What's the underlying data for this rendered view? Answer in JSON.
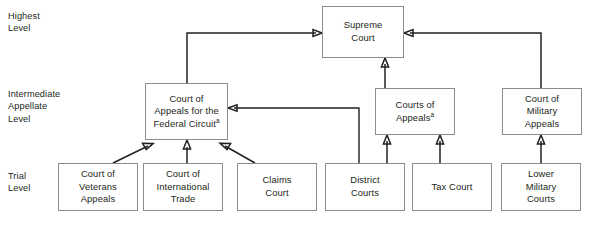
{
  "diagram": {
    "type": "hierarchy-flowchart",
    "colors": {
      "background": "#ffffff",
      "box_border": "#8c8c8c",
      "text": "#231f20",
      "arrow": "#231f20"
    },
    "level_labels": [
      {
        "id": "highest",
        "text": "Highest\nLevel"
      },
      {
        "id": "intermediate",
        "text": "Intermediate\nAppellate\nLevel"
      },
      {
        "id": "trial",
        "text": "Trial\nLevel"
      }
    ],
    "nodes": [
      {
        "id": "supreme-court",
        "label": "Supreme Court",
        "lines": [
          "Supreme",
          "Court"
        ],
        "footnote": "",
        "level": "highest"
      },
      {
        "id": "federal-circuit",
        "label": "Court of Appeals for the Federal Circuit",
        "lines": [
          "Court of",
          "Appeals for the",
          "Federal Circuit"
        ],
        "footnote": "a",
        "level": "intermediate"
      },
      {
        "id": "courts-of-appeals",
        "label": "Courts of Appeals",
        "lines": [
          "Courts of",
          "Appeals"
        ],
        "footnote": "a",
        "level": "intermediate"
      },
      {
        "id": "court-of-military-appeals",
        "label": "Court of Military Appeals",
        "lines": [
          "Court of",
          "Military",
          "Appeals"
        ],
        "footnote": "",
        "level": "intermediate"
      },
      {
        "id": "court-of-veterans-appeals",
        "label": "Court of Veterans Appeals",
        "lines": [
          "Court of",
          "Veterans",
          "Appeals"
        ],
        "footnote": "",
        "level": "trial"
      },
      {
        "id": "court-of-international-trade",
        "label": "Court of International Trade",
        "lines": [
          "Court of",
          "International",
          "Trade"
        ],
        "footnote": "",
        "level": "trial"
      },
      {
        "id": "claims-court",
        "label": "Claims Court",
        "lines": [
          "Claims",
          "Court"
        ],
        "footnote": "",
        "level": "trial"
      },
      {
        "id": "district-courts",
        "label": "District Courts",
        "lines": [
          "District",
          "Courts"
        ],
        "footnote": "",
        "level": "trial"
      },
      {
        "id": "tax-court",
        "label": "Tax Court",
        "lines": [
          "Tax Court"
        ],
        "footnote": "",
        "level": "trial"
      },
      {
        "id": "lower-military-courts",
        "label": "Lower Military Courts",
        "lines": [
          "Lower",
          "Military",
          "Courts"
        ],
        "footnote": "",
        "level": "trial"
      }
    ],
    "edges": [
      {
        "from": "federal-circuit",
        "to": "supreme-court",
        "style": "orthogonal"
      },
      {
        "from": "courts-of-appeals",
        "to": "supreme-court",
        "style": "straight"
      },
      {
        "from": "court-of-military-appeals",
        "to": "supreme-court",
        "style": "orthogonal"
      },
      {
        "from": "court-of-veterans-appeals",
        "to": "federal-circuit",
        "style": "diagonal"
      },
      {
        "from": "court-of-international-trade",
        "to": "federal-circuit",
        "style": "straight"
      },
      {
        "from": "claims-court",
        "to": "federal-circuit",
        "style": "diagonal"
      },
      {
        "from": "district-courts",
        "to": "federal-circuit",
        "style": "orthogonal"
      },
      {
        "from": "district-courts",
        "to": "courts-of-appeals",
        "style": "straight"
      },
      {
        "from": "tax-court",
        "to": "courts-of-appeals",
        "style": "straight"
      },
      {
        "from": "lower-military-courts",
        "to": "court-of-military-appeals",
        "style": "straight"
      }
    ]
  }
}
